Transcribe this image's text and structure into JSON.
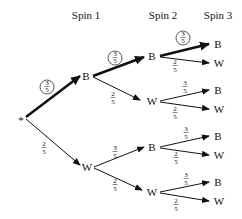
{
  "headers": [
    "Spin 1",
    "Spin 2",
    "Spin 3"
  ],
  "root": {
    "label": "*"
  },
  "level1": [
    {
      "label": "B",
      "prob_num": "3",
      "prob_den": "5",
      "circled": true,
      "bold": true
    },
    {
      "label": "W",
      "prob_num": "2",
      "prob_den": "5",
      "circled": false,
      "bold": false
    }
  ],
  "level2": [
    {
      "label": "B",
      "parent": "B",
      "prob_num": "3",
      "prob_den": "5",
      "circled": true,
      "bold": true
    },
    {
      "label": "W",
      "parent": "B",
      "prob_num": "2",
      "prob_den": "5",
      "circled": false,
      "bold": false
    },
    {
      "label": "B",
      "parent": "W",
      "prob_num": "3",
      "prob_den": "5",
      "circled": false,
      "bold": false
    },
    {
      "label": "W",
      "parent": "W",
      "prob_num": "2",
      "prob_den": "5",
      "circled": false,
      "bold": false
    }
  ],
  "level3": [
    {
      "label": "B",
      "prob_num": "3",
      "prob_den": "5",
      "circled": true,
      "bold": true
    },
    {
      "label": "W",
      "prob_num": "2",
      "prob_den": "5",
      "circled": false,
      "bold": false
    },
    {
      "label": "B",
      "prob_num": "3",
      "prob_den": "5",
      "circled": false,
      "bold": false
    },
    {
      "label": "W",
      "prob_num": "2",
      "prob_den": "5",
      "circled": false,
      "bold": false
    },
    {
      "label": "B",
      "prob_num": "3",
      "prob_den": "5",
      "circled": false,
      "bold": false
    },
    {
      "label": "W",
      "prob_num": "2",
      "prob_den": "5",
      "circled": false,
      "bold": false
    },
    {
      "label": "B",
      "prob_num": "3",
      "prob_den": "5",
      "circled": false,
      "bold": false
    },
    {
      "label": "W",
      "prob_num": "2",
      "prob_den": "5",
      "circled": false,
      "bold": false
    }
  ]
}
